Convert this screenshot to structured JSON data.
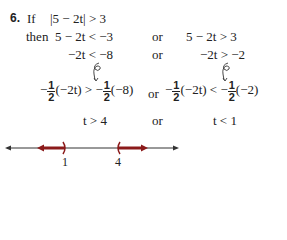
{
  "problem": {
    "number": "6.",
    "if_label": "If",
    "condition": "|5 − 2t| > 3",
    "then_label": "then",
    "row1": {
      "left": "5 − 2t < −3",
      "or": "or",
      "right": "5 − 2t > 3"
    },
    "row2": {
      "left": "−2t < −8",
      "or": "or",
      "right": "−2t > −2"
    },
    "row3": {
      "left_a": "−",
      "left_frac_num": "1",
      "left_frac_den": "2",
      "left_b": "(−2t) > −",
      "left_frac2_num": "1",
      "left_frac2_den": "2",
      "left_c": "(−8)",
      "or": "or",
      "right_a": "−",
      "right_frac_num": "1",
      "right_frac_den": "2",
      "right_b": "(−2t) < −",
      "right_frac2_num": "1",
      "right_frac2_den": "2",
      "right_c": "(−2)"
    },
    "row4": {
      "left": "t > 4",
      "or": "or",
      "right": "t < 1"
    }
  },
  "number_line": {
    "tick_labels": [
      "1",
      "4"
    ],
    "axis_color": "#333333",
    "solution_color": "#8b1a1a"
  }
}
